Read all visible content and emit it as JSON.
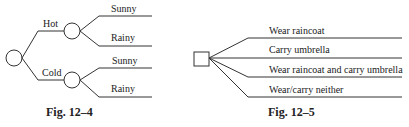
{
  "fig_12_4": {
    "caption": "Fig. 12–4",
    "branch_labels": [
      "Hot",
      "Cold"
    ],
    "outcome_labels": [
      "Sunny",
      "Rainy",
      "Sunny",
      "Rainy"
    ]
  },
  "fig_12_5": {
    "caption": "Fig. 12–5",
    "branch_labels": [
      "Wear raincoat",
      "Carry umbrella",
      "Wear raincoat and carry umbrella",
      "Wear/carry neither"
    ]
  }
}
